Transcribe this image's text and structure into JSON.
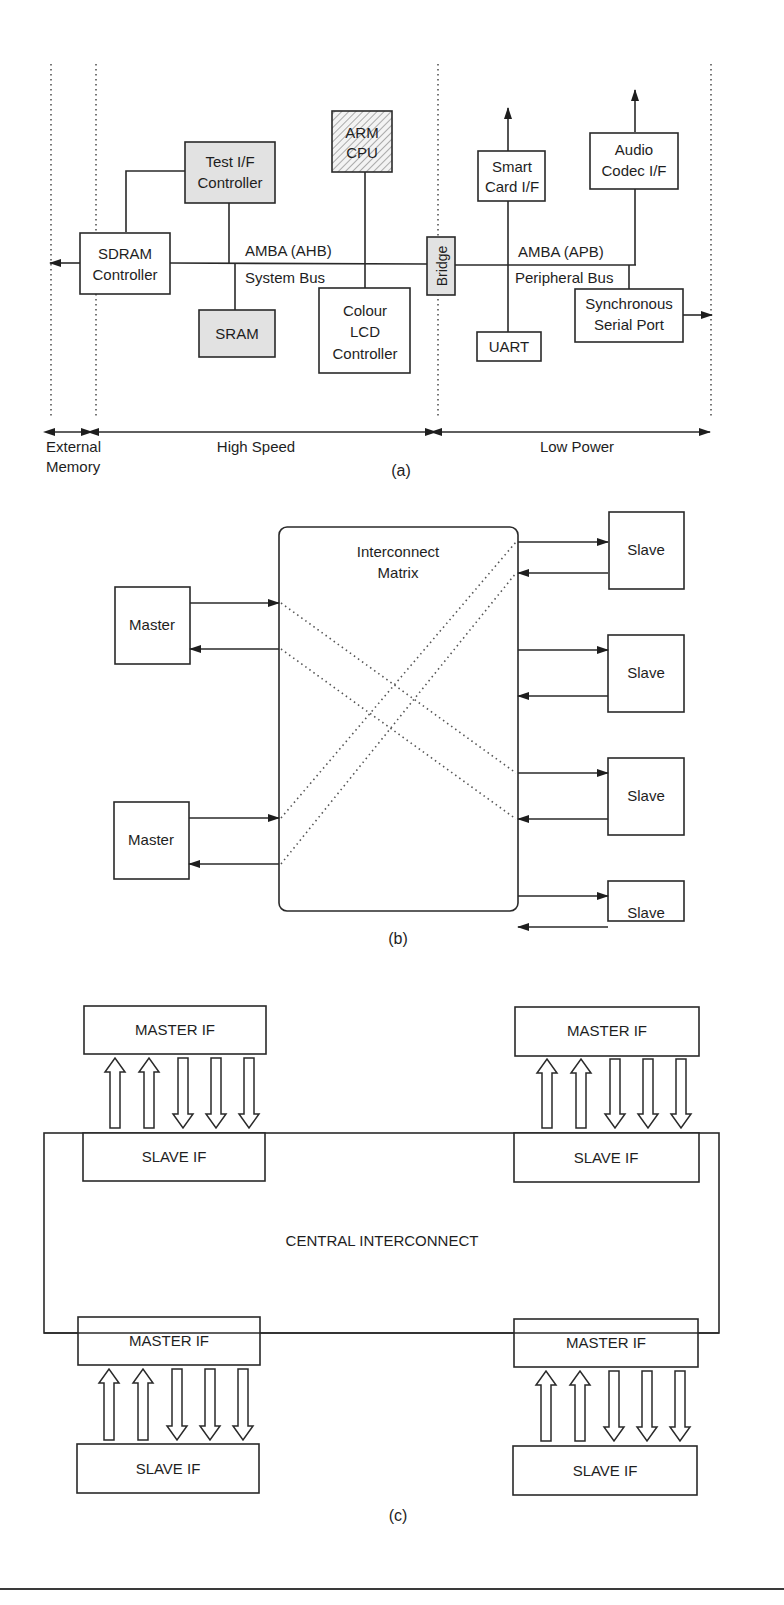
{
  "figure_a": {
    "caption": "(a)",
    "blocks": {
      "test_if": [
        "Test I/F",
        "Controller"
      ],
      "arm_cpu": [
        "ARM",
        "CPU"
      ],
      "sdram": [
        "SDRAM",
        "Controller"
      ],
      "sram": "SRAM",
      "lcd": [
        "Colour",
        "LCD",
        "Controller"
      ],
      "bridge": "Bridge",
      "smart_card": [
        "Smart",
        "Card I/F"
      ],
      "audio": [
        "Audio",
        "Codec I/F"
      ],
      "uart": "UART",
      "ssp": [
        "Synchronous",
        "Serial Port"
      ]
    },
    "bus_labels": {
      "ahb": "AMBA (AHB)",
      "system_bus": "System Bus",
      "apb": "AMBA (APB)",
      "peripheral_bus": "Peripheral Bus"
    },
    "regions": {
      "external_memory": [
        "External",
        "Memory"
      ],
      "high_speed": "High Speed",
      "low_power": "Low Power"
    },
    "colors": {
      "shaded_block": "#e2e2e2",
      "line": "#2a2a2a"
    }
  },
  "figure_b": {
    "caption": "(b)",
    "matrix_label": [
      "Interconnect",
      "Matrix"
    ],
    "masters": [
      "Master",
      "Master"
    ],
    "slaves": [
      "Slave",
      "Slave",
      "Slave",
      "Slave"
    ]
  },
  "figure_c": {
    "caption": "(c)",
    "central_label": "CENTRAL INTERCONNECT",
    "top_master_ifs": [
      "MASTER IF",
      "MASTER IF"
    ],
    "top_slave_ifs": [
      "SLAVE IF",
      "SLAVE IF"
    ],
    "bottom_master_ifs": [
      "MASTER IF",
      "MASTER IF"
    ],
    "bottom_slave_ifs": [
      "SLAVE IF",
      "SLAVE IF"
    ],
    "arrows_per_port": {
      "up": 2,
      "down": 3
    }
  }
}
